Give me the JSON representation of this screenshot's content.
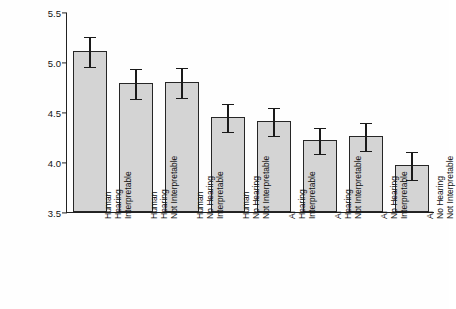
{
  "chart_data": {
    "type": "bar",
    "title": "",
    "xlabel": "",
    "ylabel": "Procedural Fairness Rating",
    "ylim": [
      3.5,
      5.5
    ],
    "yticks": [
      "3.5",
      "4.0",
      "4.5",
      "5.0",
      "5.5"
    ],
    "grid": false,
    "legend": false,
    "categories": [
      "Human Hearing Interpretable",
      "Human Hearing Not Interpretable",
      "Human No Hearing Interpretable",
      "Human No Hearing Not Interpretable",
      "AI Hearing Interpretable",
      "AI Hearing Not Interpretable",
      "AI No Hearing Interpretable",
      "AI No Hearing Not Interpretable"
    ],
    "category_lines": [
      [
        "Human",
        "Hearing",
        "Interpretable"
      ],
      [
        "Human",
        "Hearing",
        "Not Interpretable"
      ],
      [
        "Human",
        "No Hearing",
        "Interpretable"
      ],
      [
        "Human",
        "No Hearing",
        "Not Interpretable"
      ],
      [
        "AI",
        "Hearing",
        "Interpretable"
      ],
      [
        "AI",
        "Hearing",
        "Not Interpretable"
      ],
      [
        "AI",
        "No Hearing",
        "Interpretable"
      ],
      [
        "AI",
        "No Hearing",
        "Not Interpretable"
      ]
    ],
    "values": [
      5.11,
      4.79,
      4.8,
      4.45,
      4.41,
      4.22,
      4.26,
      3.97
    ],
    "errors": [
      0.15,
      0.15,
      0.15,
      0.14,
      0.14,
      0.13,
      0.14,
      0.14
    ],
    "bar_fill": "#d4d4d4",
    "bar_edge": "#262626",
    "axis_color": "#222222"
  }
}
